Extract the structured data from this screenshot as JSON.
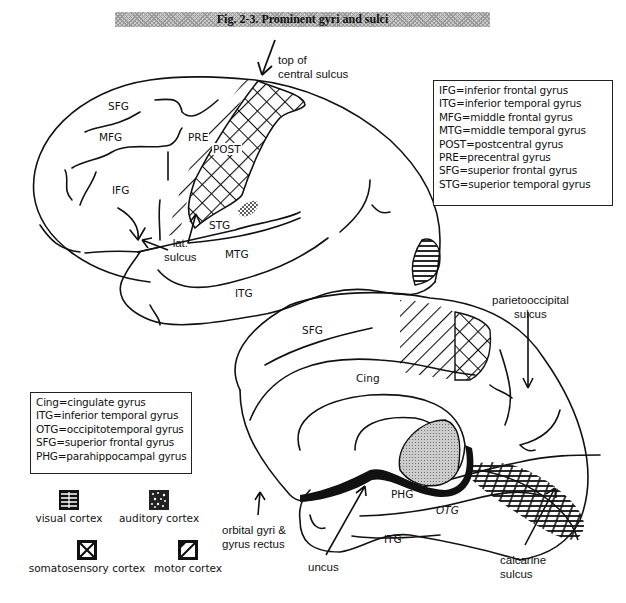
{
  "title": "Fig. 2-3. Prominent gyri and sulci",
  "lateral_view": {
    "region_labels": {
      "sfg": "SFG",
      "mfg": "MFG",
      "ifg": "IFG",
      "pre": "PRE",
      "post": "POST",
      "stg": "STG",
      "mtg": "MTG",
      "itg": "ITG"
    },
    "callouts": {
      "central_sulcus": [
        "top of",
        "central sulcus"
      ],
      "lateral_sulcus": [
        "lat.",
        "sulcus"
      ]
    }
  },
  "medial_view": {
    "region_labels": {
      "sfg": "SFG",
      "cing": "Cing",
      "phg": "PHG",
      "otg": "OTG",
      "itg": "ITG"
    },
    "callouts": {
      "parietooccipital": [
        "parietooccipital",
        "sulcus"
      ],
      "calcarine": [
        "calcarine",
        "sulcus"
      ],
      "uncus": [
        "uncus"
      ],
      "orbital": [
        "orbital gyri &",
        "gyrus rectus"
      ]
    }
  },
  "legend_lateral": [
    "IFG=inferior frontal gyrus",
    "ITG=inferior temporal gyrus",
    "MFG=middle frontal gyrus",
    "MTG=middle temporal gyrus",
    "POST=postcentral gyrus",
    "PRE=precentral gyrus",
    "SFG=superior frontal gyrus",
    "STG=superior temporal gyrus"
  ],
  "legend_medial": [
    "Cing=cingulate gyrus",
    "ITG=inferior temporal gyrus",
    "OTG=occipitotemporal gyrus",
    "SFG=superior frontal gyrus",
    "PHG=parahippocampal gyrus"
  ],
  "pattern_key": [
    {
      "label": "visual cortex",
      "pattern": "horizontal-lines"
    },
    {
      "label": "auditory cortex",
      "pattern": "stipple"
    },
    {
      "label": "somatosensory cortex",
      "pattern": "crosshatch"
    },
    {
      "label": "motor cortex",
      "pattern": "diagonal-lines"
    }
  ]
}
